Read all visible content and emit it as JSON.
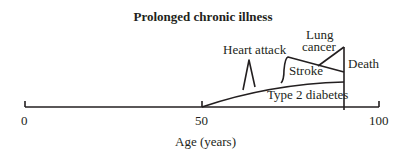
{
  "title": "Prolonged chronic illness",
  "axis": {
    "label": "Age (years)",
    "ticks": [
      "0",
      "50",
      "100"
    ]
  },
  "labels": {
    "heart_attack": "Heart attack",
    "lung_line1": "Lung",
    "lung_line2": "cancer",
    "stroke": "Stroke",
    "death": "Death",
    "diabetes": "Type 2 diabetes"
  },
  "colors": {
    "line": "#231f20",
    "background": "#ffffff"
  }
}
